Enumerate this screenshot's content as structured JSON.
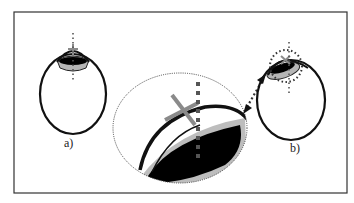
{
  "figure": {
    "panels": [
      {
        "id": "a",
        "label": "a)"
      },
      {
        "id": "b",
        "label": "b)"
      }
    ],
    "colors": {
      "outline": "#111111",
      "lens_fill": "#000000",
      "lens_ring": "#b5b5b5",
      "cross_marker": "#8a8a8a",
      "axis_dots": "#666666",
      "frame": "#333333"
    },
    "elements": {
      "eye_a": "eye-outline-centered-lens",
      "eye_b": "eye-outline-tilted-lens",
      "magnified_view": "magnified-lens-detail",
      "arrow": "double-headed-dotted-arrow"
    }
  }
}
